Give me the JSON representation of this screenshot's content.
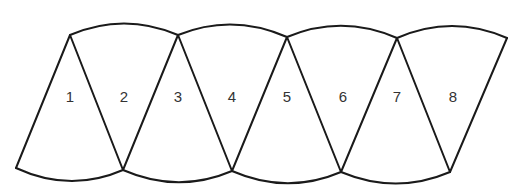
{
  "diagram": {
    "type": "net of cone segments / gore strip",
    "segments": [
      {
        "label": "1",
        "x": 70,
        "y": 98
      },
      {
        "label": "2",
        "x": 124,
        "y": 98
      },
      {
        "label": "3",
        "x": 178,
        "y": 98
      },
      {
        "label": "4",
        "x": 232,
        "y": 98
      },
      {
        "label": "5",
        "x": 287,
        "y": 98
      },
      {
        "label": "6",
        "x": 343,
        "y": 98
      },
      {
        "label": "7",
        "x": 397,
        "y": 98
      },
      {
        "label": "8",
        "x": 453,
        "y": 98
      }
    ],
    "colors": {
      "stroke": "#1a1a1a",
      "label": "#333333",
      "background": "#ffffff"
    }
  }
}
